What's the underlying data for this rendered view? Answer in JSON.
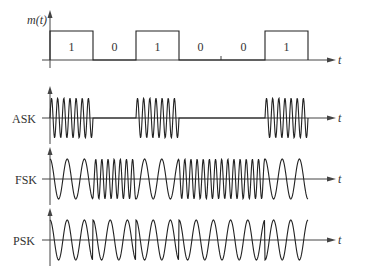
{
  "signals": {
    "message": {
      "label": "m(t)",
      "bits": [
        "1",
        "0",
        "1",
        "0",
        "0",
        "1"
      ]
    },
    "ask": {
      "label": "ASK"
    },
    "fsk": {
      "label": "FSK"
    },
    "psk": {
      "label": "PSK"
    }
  },
  "axis_label": "t",
  "layout": {
    "x0": 50,
    "bit_width": 43,
    "x_end": 330,
    "m_base": 60,
    "m_top": 31,
    "ask_y": 118,
    "fsk_y": 179,
    "psk_y": 240,
    "amp": 20,
    "ask_cycles_per_bit": 7,
    "fsk_low_cycles": 2.5,
    "fsk_high_cycles": 7,
    "psk_cycles_per_bit": 2.5
  },
  "colors": {
    "stroke": "#222222",
    "axis": "#444444"
  }
}
